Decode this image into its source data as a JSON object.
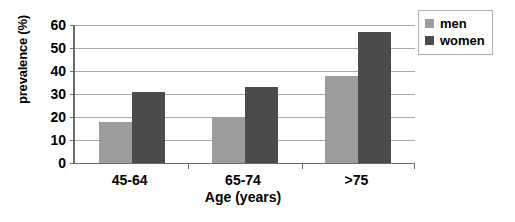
{
  "chart_data": {
    "type": "bar",
    "title": "",
    "xlabel": "Age (years)",
    "ylabel": "prevalence (%)",
    "categories": [
      "45-64",
      "65-74",
      ">75"
    ],
    "series": [
      {
        "name": "men",
        "color": "#9d9d9d",
        "values": [
          18,
          20,
          38
        ]
      },
      {
        "name": "women",
        "color": "#4b4b4b",
        "values": [
          31,
          33,
          57
        ]
      }
    ],
    "ylim": [
      0,
      60
    ],
    "ytick_values": [
      0,
      10,
      20,
      30,
      40,
      50,
      60
    ],
    "ytick_labels": [
      "0",
      "10",
      "20",
      "30",
      "40",
      "50",
      "60"
    ],
    "grid": "horizontal",
    "legend_position": "top-right",
    "legend_entries": [
      "men",
      "women"
    ]
  },
  "axes": {
    "y_title": "prevalence (%)",
    "x_title": "Age (years)"
  },
  "legend": {
    "items": [
      {
        "label": "men"
      },
      {
        "label": "women"
      }
    ]
  }
}
